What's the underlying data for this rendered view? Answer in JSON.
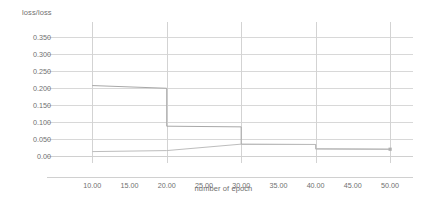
{
  "chart_data": {
    "type": "line",
    "title": "",
    "xlabel": "number of epoch",
    "ylabel": "loss/loss",
    "xlim": [
      5,
      52
    ],
    "ylim": [
      0.0,
      0.375
    ],
    "grid": true,
    "legend": "none",
    "y_ticks": [
      "0.350",
      "0.300",
      "0.250",
      "0.200",
      "0.150",
      "0.100",
      "0.050",
      "0.00"
    ],
    "y_tick_values": [
      0.35,
      0.3,
      0.25,
      0.2,
      0.15,
      0.1,
      0.05,
      0.0
    ],
    "x_ticks": [
      "10.00",
      "15.00",
      "20.00",
      "25.00",
      "30.00",
      "35.00",
      "40.00",
      "45.00",
      "50.00"
    ],
    "x_tick_values": [
      10,
      15,
      20,
      25,
      30,
      35,
      40,
      45,
      50
    ],
    "x_gridline_values": [
      10,
      20,
      30,
      40,
      50
    ],
    "series": [
      {
        "name": "loss",
        "color": "#a8a8a8",
        "style": "step",
        "x": [
          10,
          20,
          20,
          30,
          30,
          40,
          40,
          50
        ],
        "values": [
          0.208,
          0.2,
          0.088,
          0.086,
          0.035,
          0.034,
          0.021,
          0.02
        ]
      },
      {
        "name": "loss",
        "color": "#bdbdbd",
        "style": "step",
        "x": [
          10,
          20,
          30,
          30,
          40,
          40,
          50
        ],
        "values": [
          0.013,
          0.016,
          0.035,
          0.034,
          0.034,
          0.021,
          0.02
        ]
      }
    ],
    "end_marker": {
      "x": 50,
      "y": 0.02
    }
  }
}
